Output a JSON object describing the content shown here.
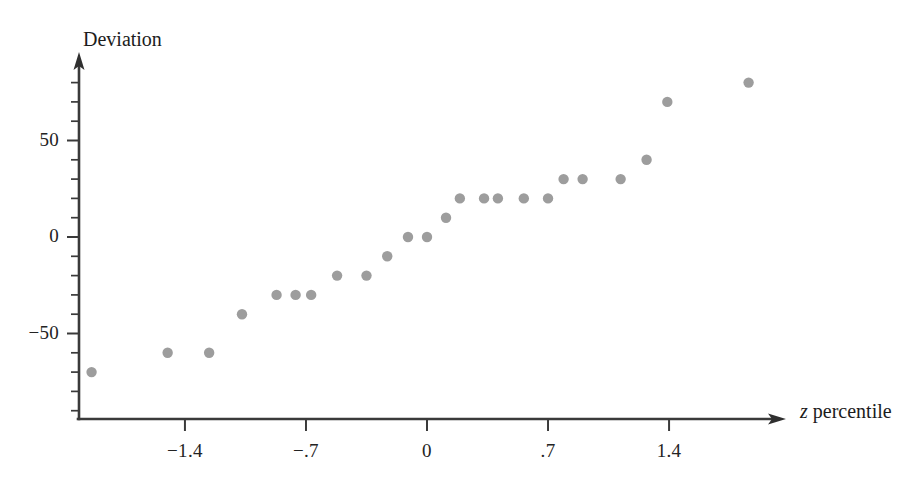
{
  "chart_data": {
    "type": "scatter",
    "title": "",
    "xlabel": "z percentile",
    "ylabel": "Deviation",
    "xlim": [
      -2.1,
      2.1
    ],
    "ylim": [
      -95,
      92
    ],
    "grid": false,
    "legend": "none",
    "x_ticks": [
      -1.4,
      -0.7,
      0,
      0.7,
      1.4
    ],
    "x_tick_labels": [
      "−1.4",
      "−.7",
      "0",
      ".7",
      "1.4"
    ],
    "y_ticks": [
      50,
      0,
      -50
    ],
    "y_tick_labels": [
      "50",
      "0",
      "−50"
    ],
    "y_minor_tick_step": 10,
    "point_color": "#9d9d9d",
    "axis_color": "#3a3a3a",
    "points": [
      {
        "x": -1.94,
        "y": -70
      },
      {
        "x": -1.5,
        "y": -60
      },
      {
        "x": -1.26,
        "y": -60
      },
      {
        "x": -1.07,
        "y": -40
      },
      {
        "x": -0.87,
        "y": -30
      },
      {
        "x": -0.76,
        "y": -30
      },
      {
        "x": -0.67,
        "y": -30
      },
      {
        "x": -0.52,
        "y": -20
      },
      {
        "x": -0.35,
        "y": -20
      },
      {
        "x": -0.23,
        "y": -10
      },
      {
        "x": -0.11,
        "y": 0
      },
      {
        "x": 0.0,
        "y": 0
      },
      {
        "x": 0.11,
        "y": 10
      },
      {
        "x": 0.19,
        "y": 20
      },
      {
        "x": 0.33,
        "y": 20
      },
      {
        "x": 0.41,
        "y": 20
      },
      {
        "x": 0.56,
        "y": 20
      },
      {
        "x": 0.7,
        "y": 20
      },
      {
        "x": 0.79,
        "y": 30
      },
      {
        "x": 0.9,
        "y": 30
      },
      {
        "x": 1.12,
        "y": 30
      },
      {
        "x": 1.27,
        "y": 40
      },
      {
        "x": 1.39,
        "y": 70
      },
      {
        "x": 1.86,
        "y": 80
      }
    ]
  },
  "axes": {
    "y_title": "Deviation",
    "x_title_var": "z",
    "x_title_rest": " percentile"
  }
}
